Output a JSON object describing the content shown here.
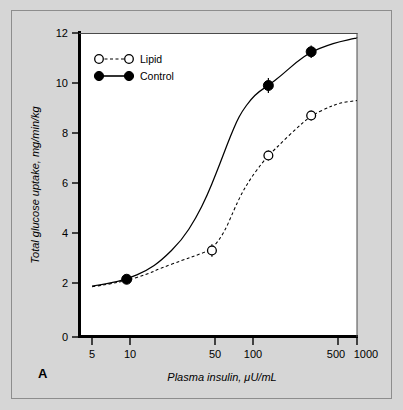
{
  "figure": {
    "panel_letter": "A",
    "background_color": "#d6d6d6",
    "plot_background_color": "#ffffff",
    "frame_color": "#8d8d8d"
  },
  "chart_data": {
    "type": "line",
    "title": "",
    "xlabel": "Plasma insulin, μU/mL",
    "ylabel": "Total glucose uptake, mg/min/kg",
    "xscale": "log",
    "xlim": [
      5,
      1000
    ],
    "ylim": [
      0,
      12
    ],
    "xticks": [
      5,
      10,
      50,
      100,
      500,
      1000
    ],
    "xtick_labels": [
      "5",
      "10",
      "50",
      "100",
      "500",
      "1000"
    ],
    "yticks": [
      0,
      2,
      4,
      6,
      8,
      10,
      12
    ],
    "ytick_labels": [
      "0",
      "2",
      "4",
      "6",
      "8",
      "10",
      "12"
    ],
    "grid": false,
    "legend_position": "upper-left",
    "series": [
      {
        "name": "Lipid",
        "marker": "open-circle",
        "linestyle": "dashed",
        "color": "#000000",
        "x": [
          55,
          170,
          400
        ],
        "y": [
          3.3,
          7.1,
          8.7
        ],
        "yerr": [
          0.25,
          0.2,
          0.2
        ],
        "curve": [
          [
            5,
            1.85
          ],
          [
            7,
            1.95
          ],
          [
            10,
            2.1
          ],
          [
            15,
            2.35
          ],
          [
            20,
            2.6
          ],
          [
            30,
            2.9
          ],
          [
            40,
            3.1
          ],
          [
            55,
            3.35
          ],
          [
            70,
            4.0
          ],
          [
            85,
            4.9
          ],
          [
            100,
            5.6
          ],
          [
            120,
            6.2
          ],
          [
            150,
            6.8
          ],
          [
            170,
            7.1
          ],
          [
            220,
            7.6
          ],
          [
            300,
            8.2
          ],
          [
            400,
            8.7
          ],
          [
            550,
            9.0
          ],
          [
            700,
            9.2
          ],
          [
            1000,
            9.3
          ]
        ]
      },
      {
        "name": "Control",
        "marker": "filled-circle",
        "linestyle": "solid",
        "color": "#000000",
        "x": [
          10,
          170,
          400
        ],
        "y": [
          2.15,
          9.9,
          11.25
        ],
        "yerr": [
          0.0,
          0.3,
          0.25
        ],
        "curve": [
          [
            5,
            1.88
          ],
          [
            7,
            1.98
          ],
          [
            10,
            2.15
          ],
          [
            15,
            2.5
          ],
          [
            20,
            2.9
          ],
          [
            30,
            3.7
          ],
          [
            40,
            4.6
          ],
          [
            50,
            5.5
          ],
          [
            60,
            6.4
          ],
          [
            70,
            7.2
          ],
          [
            80,
            7.9
          ],
          [
            90,
            8.45
          ],
          [
            100,
            8.85
          ],
          [
            120,
            9.35
          ],
          [
            140,
            9.65
          ],
          [
            170,
            9.9
          ],
          [
            220,
            10.3
          ],
          [
            300,
            10.85
          ],
          [
            400,
            11.25
          ],
          [
            550,
            11.5
          ],
          [
            700,
            11.65
          ],
          [
            1000,
            11.8
          ]
        ]
      }
    ]
  },
  "legend": {
    "entries": [
      {
        "label": "Lipid",
        "marker": "open-circle",
        "linestyle": "dashed"
      },
      {
        "label": "Control",
        "marker": "filled-circle",
        "linestyle": "solid"
      }
    ]
  }
}
